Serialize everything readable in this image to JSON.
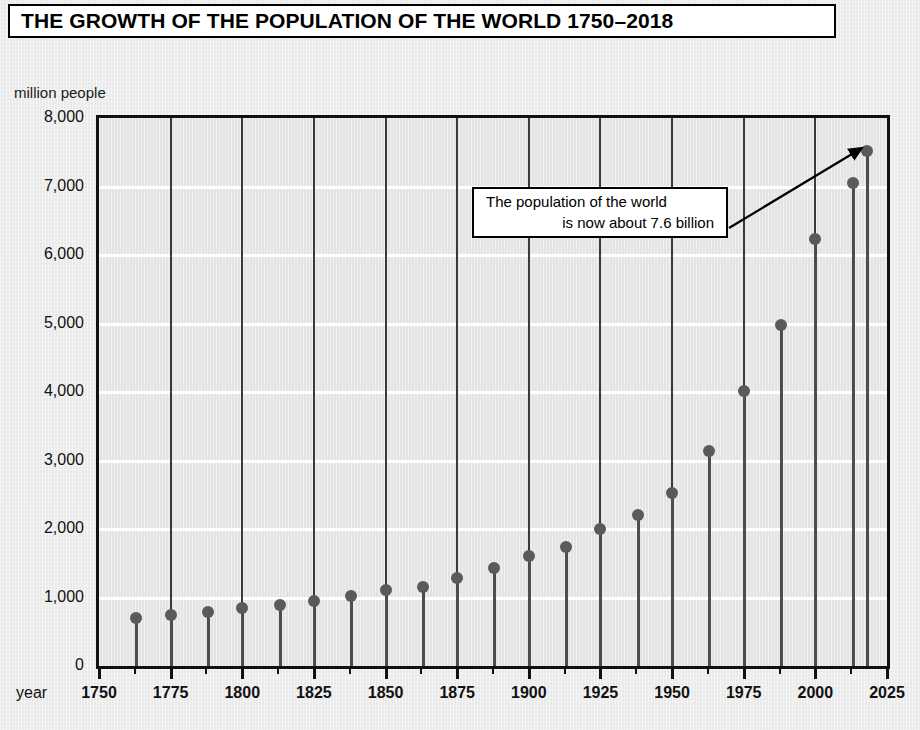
{
  "title": "THE GROWTH OF THE POPULATION OF THE WORLD 1750–2018",
  "y_unit_caption": "million people",
  "x_axis_caption": "year",
  "annotation": {
    "line1": "The population of the world",
    "line2": "is now about 7.6 billion"
  },
  "colors": {
    "page_background": "#e9e9e9",
    "plot_background": "#e3e3e3",
    "gridline": "#ffffff",
    "axis": "#111111",
    "marker": "#5a5a5a",
    "stem": "#4d4d4d",
    "box_fill": "#ffffff",
    "box_border": "#000000",
    "text": "#111111"
  },
  "chart_data": {
    "type": "bar",
    "title": "THE GROWTH OF THE POPULATION OF THE WORLD 1750–2018",
    "subtitle": "",
    "xlabel": "year",
    "ylabel": "million people",
    "xlim": [
      1750,
      2025
    ],
    "ylim": [
      0,
      8000
    ],
    "ytick_labels": [
      "0",
      "1,000",
      "2,000",
      "3,000",
      "4,000",
      "5,000",
      "6,000",
      "7,000",
      "8,000"
    ],
    "ytick_values": [
      0,
      1000,
      2000,
      3000,
      4000,
      5000,
      6000,
      7000,
      8000
    ],
    "xtick_labels": [
      "1750",
      "1775",
      "1800",
      "1825",
      "1850",
      "1875",
      "1900",
      "1925",
      "1950",
      "1975",
      "2000",
      "2025"
    ],
    "xtick_values": [
      1750,
      1775,
      1800,
      1825,
      1850,
      1875,
      1900,
      1925,
      1950,
      1975,
      2000,
      2025
    ],
    "xtick_minor_step": 12.5,
    "grid": "horizontal",
    "legend": "none",
    "marker_style": "lollipop",
    "x": [
      1763,
      1775,
      1788,
      1800,
      1813,
      1825,
      1838,
      1850,
      1863,
      1875,
      1888,
      1900,
      1913,
      1925,
      1938,
      1950,
      1963,
      1975,
      1988,
      2000,
      2013,
      2018
    ],
    "values": [
      700,
      740,
      790,
      850,
      890,
      955,
      1020,
      1110,
      1160,
      1280,
      1430,
      1610,
      1740,
      2000,
      2200,
      2520,
      3140,
      4020,
      4980,
      6230,
      7050,
      7520
    ],
    "annotations": [
      {
        "text": "The population of the world is now about 7.6 billion",
        "points_to_year": 2018,
        "points_to_value": 7520
      }
    ]
  }
}
